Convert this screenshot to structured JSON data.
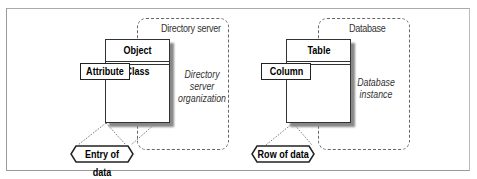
{
  "left_diagram": {
    "container_label": "Directory server",
    "container_description": [
      "Directory",
      "server",
      "organization"
    ],
    "class_title": "Object Class",
    "attribute_label": "Attribute",
    "data_label": "Entry of data"
  },
  "right_diagram": {
    "container_label": "Database",
    "container_description": [
      "Database",
      "instance"
    ],
    "class_title": "Table",
    "attribute_label": "Column",
    "data_label": "Row of data"
  }
}
